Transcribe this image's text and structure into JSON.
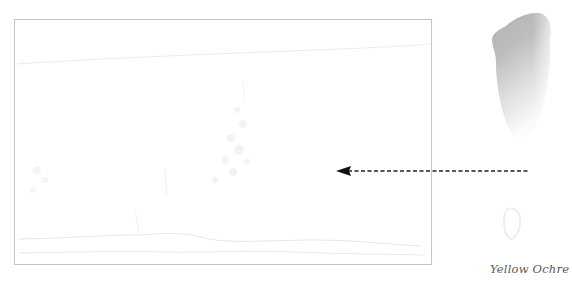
{
  "diagram": {
    "type": "watercolor-color-application-step",
    "paper_frame": {
      "description": "faint pencil sketch of a landscape inside a rectangular border",
      "border_color": "#c4c4c4"
    },
    "swatch": {
      "label": "Yellow Ochre",
      "tone_top": "#a9a9a9",
      "tone_bottom": "#f4f4f4"
    },
    "arrow": {
      "style": "dashed",
      "direction": "left",
      "color": "#222222",
      "from": "swatch",
      "to": "paper_frame"
    }
  }
}
